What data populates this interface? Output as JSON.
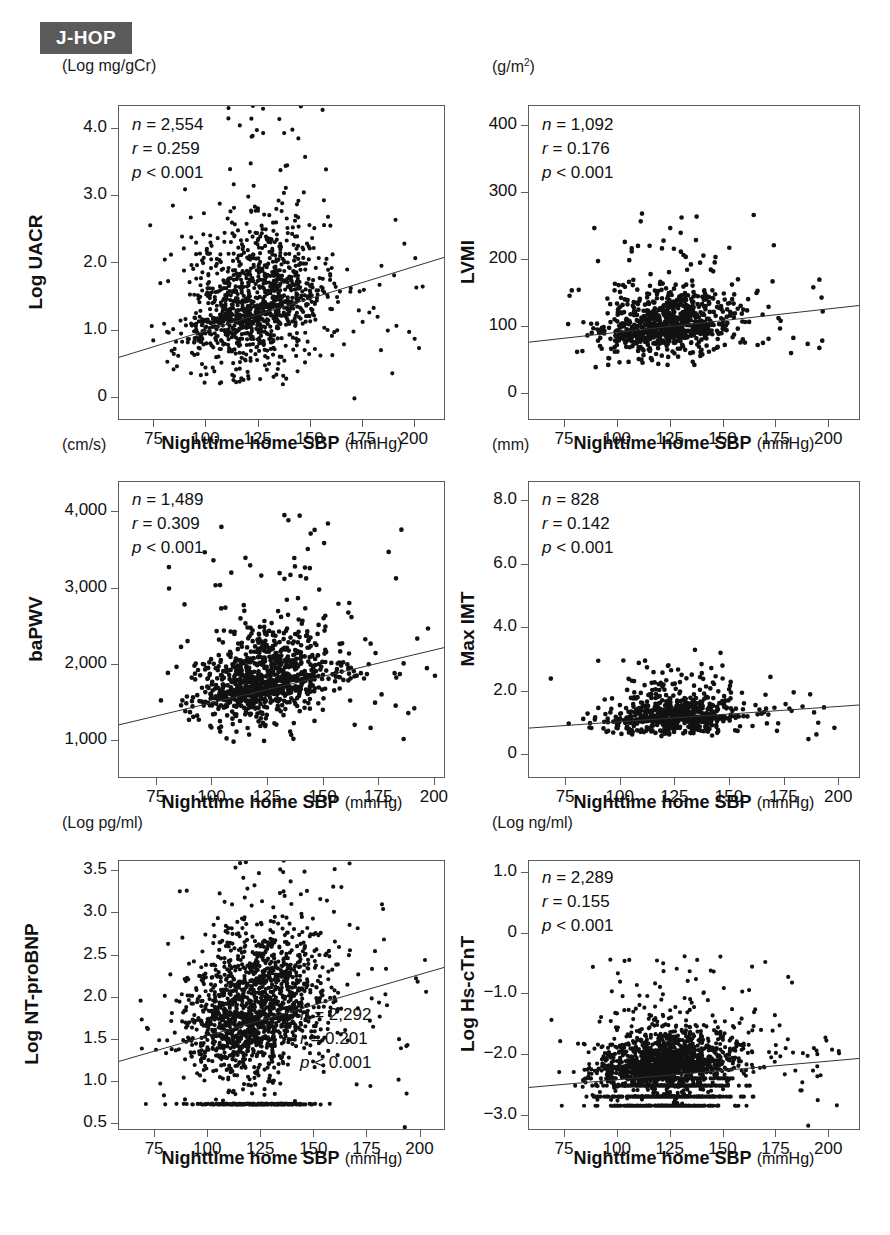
{
  "study": {
    "badge_label": "J-HOP"
  },
  "shared": {
    "x_axis_title_bold": "Nighttime home SBP",
    "x_axis_title_unit": "(mmHg)",
    "x_ticks": [
      75,
      100,
      125,
      150,
      175,
      200
    ],
    "x_tick_labels": [
      "75",
      "100",
      "125",
      "150",
      "175",
      "200"
    ],
    "x_range": [
      58,
      215
    ],
    "p_value": "p < 0.001"
  },
  "chart_data": [
    {
      "id": "uacr",
      "type": "scatter",
      "title": "",
      "unit_label": "(Log mg/gCr)",
      "ylabel": "Log UACR",
      "xlabel": "Nighttime home SBP (mmHg)",
      "n": "n = 2,554",
      "r": "r = 0.259",
      "p": "p < 0.001",
      "n_value": 2554,
      "r_value": 0.259,
      "y_ticks": [
        0,
        1.0,
        2.0,
        3.0,
        4.0
      ],
      "y_tick_labels": [
        "0",
        "1.0",
        "2.0",
        "3.0",
        "4.0"
      ],
      "ylim": [
        -0.35,
        4.35
      ],
      "xlim": [
        58,
        215
      ],
      "grid": false,
      "stats_position": "top-left",
      "fit_line": {
        "x1": 58,
        "y1": 0.58,
        "x2": 215,
        "y2": 2.08
      },
      "cloud": {
        "x_mean": 123,
        "x_sd": 17,
        "y_mean": 1.35,
        "y_sd": 0.52,
        "n_points": 1150,
        "y_floor": 0.18,
        "y_skew": 0.55
      }
    },
    {
      "id": "lvmi",
      "type": "scatter",
      "title": "",
      "unit_label": "(g/m2)",
      "ylabel": "LVMI",
      "xlabel": "Nighttime home SBP (mmHg)",
      "n": "n = 1,092",
      "r": "r = 0.176",
      "p": "p < 0.001",
      "n_value": 1092,
      "r_value": 0.176,
      "y_ticks": [
        0,
        100,
        200,
        300,
        400
      ],
      "y_tick_labels": [
        "0",
        "100",
        "200",
        "300",
        "400"
      ],
      "ylim": [
        -40,
        430
      ],
      "xlim": [
        58,
        215
      ],
      "grid": false,
      "stats_position": "top-left",
      "fit_line": {
        "x1": 58,
        "y1": 76,
        "x2": 215,
        "y2": 131
      },
      "cloud": {
        "x_mean": 124,
        "x_sd": 15,
        "y_mean": 101,
        "y_sd": 23,
        "n_points": 780,
        "y_floor": 35,
        "y_skew": 0.45
      }
    },
    {
      "id": "bapwv",
      "type": "scatter",
      "title": "",
      "unit_label": "(cm/s)",
      "ylabel": "baPWV",
      "xlabel": "Nighttime home SBP (mmHg)",
      "n": "n = 1,489",
      "r": "r = 0.309",
      "p": "p < 0.001",
      "n_value": 1489,
      "r_value": 0.309,
      "y_ticks": [
        1000,
        2000,
        3000,
        4000
      ],
      "y_tick_labels": [
        "1,000",
        "2,000",
        "3,000",
        "4,000"
      ],
      "ylim": [
        500,
        4400
      ],
      "xlim": [
        58,
        205
      ],
      "grid": false,
      "stats_position": "top-left",
      "fit_line": {
        "x1": 58,
        "y1": 1195,
        "x2": 205,
        "y2": 2215
      },
      "cloud": {
        "x_mean": 124,
        "x_sd": 16,
        "y_mean": 1760,
        "y_sd": 300,
        "n_points": 940,
        "y_floor": 950,
        "y_skew": 0.5
      }
    },
    {
      "id": "maximt",
      "type": "scatter",
      "title": "",
      "unit_label": "(mm)",
      "ylabel": "Max IMT",
      "xlabel": "Nighttime home SBP (mmHg)",
      "n": "n = 828",
      "r": "r = 0.142",
      "p": "p < 0.001",
      "n_value": 828,
      "r_value": 0.142,
      "y_ticks": [
        0,
        2.0,
        4.0,
        6.0,
        8.0
      ],
      "y_tick_labels": [
        "0",
        "2.0",
        "4.0",
        "6.0",
        "8.0"
      ],
      "ylim": [
        -0.75,
        8.6
      ],
      "xlim": [
        58,
        210
      ],
      "grid": false,
      "stats_position": "top-left",
      "fit_line": {
        "x1": 58,
        "y1": 0.82,
        "x2": 210,
        "y2": 1.55
      },
      "cloud": {
        "x_mean": 124,
        "x_sd": 15,
        "y_mean": 1.12,
        "y_sd": 0.3,
        "n_points": 720,
        "y_floor": 0.55,
        "y_skew": 0.9
      }
    },
    {
      "id": "ntprobnp",
      "type": "scatter",
      "title": "",
      "unit_label": "(Log pg/ml)",
      "ylabel": "Log NT-proBNP",
      "xlabel": "Nighttime home SBP (mmHg)",
      "n": "n = 2,292",
      "r": "r = 0.201",
      "p": "p < 0.001",
      "n_value": 2292,
      "r_value": 0.201,
      "y_ticks": [
        0.5,
        1.0,
        1.5,
        2.0,
        2.5,
        3.0,
        3.5
      ],
      "y_tick_labels": [
        "0.5",
        "1.0",
        "1.5",
        "2.0",
        "2.5",
        "3.0",
        "3.5"
      ],
      "ylim": [
        0.42,
        3.62
      ],
      "xlim": [
        58,
        212
      ],
      "grid": false,
      "stats_position": "bottom-right",
      "fit_line": {
        "x1": 58,
        "y1": 1.23,
        "x2": 212,
        "y2": 2.35
      },
      "cloud": {
        "x_mean": 122,
        "x_sd": 16,
        "y_mean": 1.85,
        "y_sd": 0.42,
        "n_points": 1500,
        "y_floor": 0.72,
        "y_skew": 0.3
      }
    },
    {
      "id": "hsctnt",
      "type": "scatter",
      "title": "",
      "unit_label": "(Log ng/ml)",
      "ylabel": "Log Hs-cTnT",
      "xlabel": "Nighttime home SBP (mmHg)",
      "n": "n = 2,289",
      "r": "r = 0.155",
      "p": "p < 0.001",
      "n_value": 2289,
      "r_value": 0.155,
      "y_ticks": [
        -3.0,
        -2.0,
        -1.0,
        0,
        1.0
      ],
      "y_tick_labels": [
        "-3.0",
        "-2.0",
        "-1.0",
        "0",
        "1.0"
      ],
      "ylim": [
        -3.25,
        1.2
      ],
      "xlim": [
        58,
        215
      ],
      "grid": false,
      "stats_position": "top-left",
      "fit_line": {
        "x1": 58,
        "y1": -2.55,
        "x2": 215,
        "y2": -2.07
      },
      "cloud": {
        "x_mean": 124,
        "x_sd": 16,
        "y_mean": -2.15,
        "y_sd": 0.24,
        "n_points": 1400,
        "y_floor": -2.85,
        "y_skew": 0.6
      }
    }
  ]
}
